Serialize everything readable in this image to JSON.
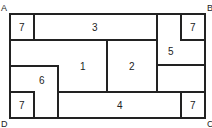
{
  "diagram": {
    "corners": {
      "A": "A",
      "B": "B",
      "C": "C",
      "D": "D"
    },
    "regions": [
      {
        "id": "r7a",
        "label": "7"
      },
      {
        "id": "r3",
        "label": "3"
      },
      {
        "id": "r7b",
        "label": "7"
      },
      {
        "id": "r5",
        "label": "5"
      },
      {
        "id": "r1",
        "label": "1"
      },
      {
        "id": "r2",
        "label": "2"
      },
      {
        "id": "r6",
        "label": "6"
      },
      {
        "id": "r7c",
        "label": "7"
      },
      {
        "id": "r4",
        "label": "4"
      },
      {
        "id": "r7d",
        "label": "7"
      }
    ],
    "colors": {
      "line": "#222222",
      "background": "#ffffff"
    }
  }
}
